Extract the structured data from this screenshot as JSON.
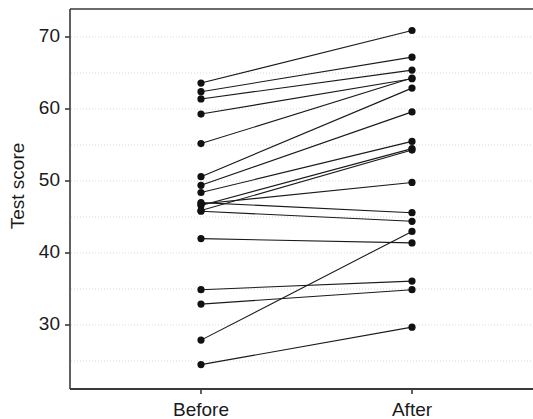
{
  "chart_data": {
    "type": "line",
    "title": "",
    "subtitle": "",
    "xlabel": "",
    "ylabel": "Test score",
    "categories": [
      "Before",
      "After"
    ],
    "x_tick_labels": [
      "Before",
      "After"
    ],
    "y_tick_labels": [
      "30",
      "40",
      "50",
      "60",
      "70"
    ],
    "y_ticks": [
      30,
      40,
      50,
      60,
      70
    ],
    "y_minor_gridlines": [
      25,
      35,
      45,
      55,
      65
    ],
    "ylim": [
      24.0,
      72.5
    ],
    "grid": "horizontal minor and major dotted gridlines",
    "legend": "none",
    "annotations": [],
    "style": "paired slope chart (before-after lines with filled circle markers)",
    "series": [
      {
        "name": "subject-1",
        "values": [
          63.6,
          70.9
        ]
      },
      {
        "name": "subject-2",
        "values": [
          62.4,
          67.2
        ]
      },
      {
        "name": "subject-3",
        "values": [
          61.4,
          65.4
        ]
      },
      {
        "name": "subject-4",
        "values": [
          59.3,
          64.2
        ]
      },
      {
        "name": "subject-5",
        "values": [
          55.2,
          64.3
        ]
      },
      {
        "name": "subject-6",
        "values": [
          50.6,
          62.9
        ]
      },
      {
        "name": "subject-7",
        "values": [
          49.4,
          59.6
        ]
      },
      {
        "name": "subject-8",
        "values": [
          48.4,
          55.5
        ]
      },
      {
        "name": "subject-9",
        "values": [
          46.6,
          54.5
        ]
      },
      {
        "name": "subject-10",
        "values": [
          45.9,
          54.3
        ]
      },
      {
        "name": "subject-11",
        "values": [
          46.8,
          49.8
        ]
      },
      {
        "name": "subject-12",
        "values": [
          47.0,
          45.6
        ]
      },
      {
        "name": "subject-13",
        "values": [
          45.8,
          44.4
        ]
      },
      {
        "name": "subject-14",
        "values": [
          42.0,
          41.4
        ]
      },
      {
        "name": "subject-15",
        "values": [
          34.9,
          36.1
        ]
      },
      {
        "name": "subject-16",
        "values": [
          32.9,
          34.9
        ]
      },
      {
        "name": "subject-17",
        "values": [
          27.9,
          43.0
        ]
      },
      {
        "name": "subject-18",
        "values": [
          24.5,
          29.7
        ]
      }
    ],
    "colors": {
      "line": "#1a1a1a",
      "marker": "#111111",
      "panel_border": "#3a3a3a",
      "gridline": "#d8d8d8",
      "background": "#ffffff",
      "text": "#1a1a1a"
    }
  },
  "geometry": {
    "panel": {
      "left": 70,
      "top": 9,
      "right": 533,
      "bottom": 389
    },
    "x_positions": {
      "Before": 201,
      "After": 412
    },
    "y_map": {
      "value_70_px": 37,
      "value_30_px": 325
    }
  }
}
